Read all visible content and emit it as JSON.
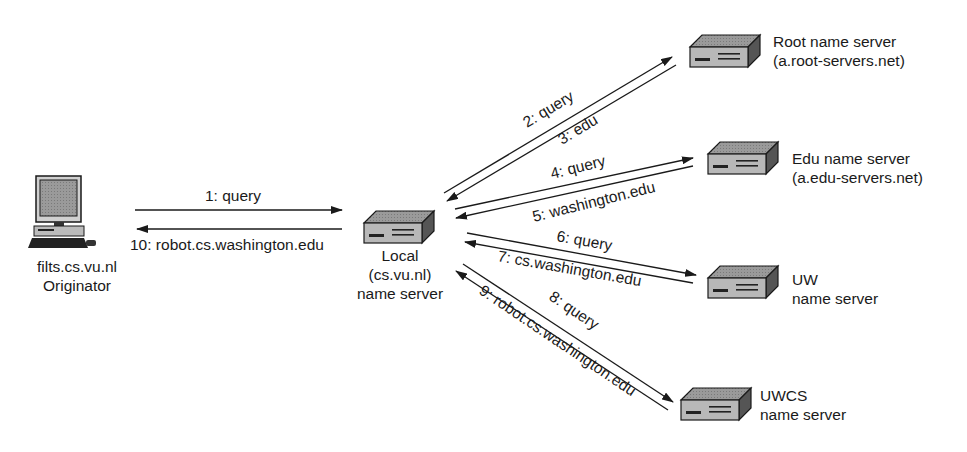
{
  "diagram": {
    "originator": {
      "host": "filts.cs.vu.nl",
      "role": "Originator"
    },
    "local_server": {
      "line1": "Local",
      "line2": "(cs.vu.nl)",
      "line3": "name server"
    },
    "root_server": {
      "line1": "Root name server",
      "line2": "(a.root-servers.net)"
    },
    "edu_server": {
      "line1": "Edu name server",
      "line2": "(a.edu-servers.net)"
    },
    "uw_server": {
      "line1": "UW",
      "line2": "name server"
    },
    "uwcs_server": {
      "line1": "UWCS",
      "line2": "name server"
    },
    "messages": [
      {
        "step": 1,
        "label": "1: query",
        "from": "originator",
        "to": "local"
      },
      {
        "step": 2,
        "label": "2: query",
        "from": "local",
        "to": "root"
      },
      {
        "step": 3,
        "label": "3: edu",
        "from": "root",
        "to": "local"
      },
      {
        "step": 4,
        "label": "4: query",
        "from": "local",
        "to": "edu"
      },
      {
        "step": 5,
        "label": "5: washington.edu",
        "from": "edu",
        "to": "local"
      },
      {
        "step": 6,
        "label": "6: query",
        "from": "local",
        "to": "uw"
      },
      {
        "step": 7,
        "label": "7: cs.washington.edu",
        "from": "uw",
        "to": "local"
      },
      {
        "step": 8,
        "label": "8: query",
        "from": "local",
        "to": "uwcs"
      },
      {
        "step": 9,
        "label": "9: robot.cs.washington.edu",
        "from": "uwcs",
        "to": "local"
      },
      {
        "step": 10,
        "label": "10: robot.cs.washington.edu",
        "from": "local",
        "to": "originator"
      }
    ]
  }
}
